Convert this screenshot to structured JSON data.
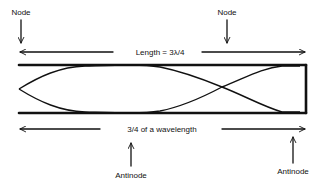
{
  "diagram": {
    "labels": {
      "node_left": "Node",
      "node_right": "Node",
      "length_top": "Length = 3λ/4",
      "length_bottom": "3/4 of a wavelength",
      "antinode_left": "Antinode",
      "antinode_right": "Antinode"
    },
    "tube": {
      "left_end": "open",
      "right_end": "closed",
      "wavelength_fraction": "3/4"
    },
    "colors": {
      "ink": "#111111",
      "background": "#ffffff"
    }
  }
}
